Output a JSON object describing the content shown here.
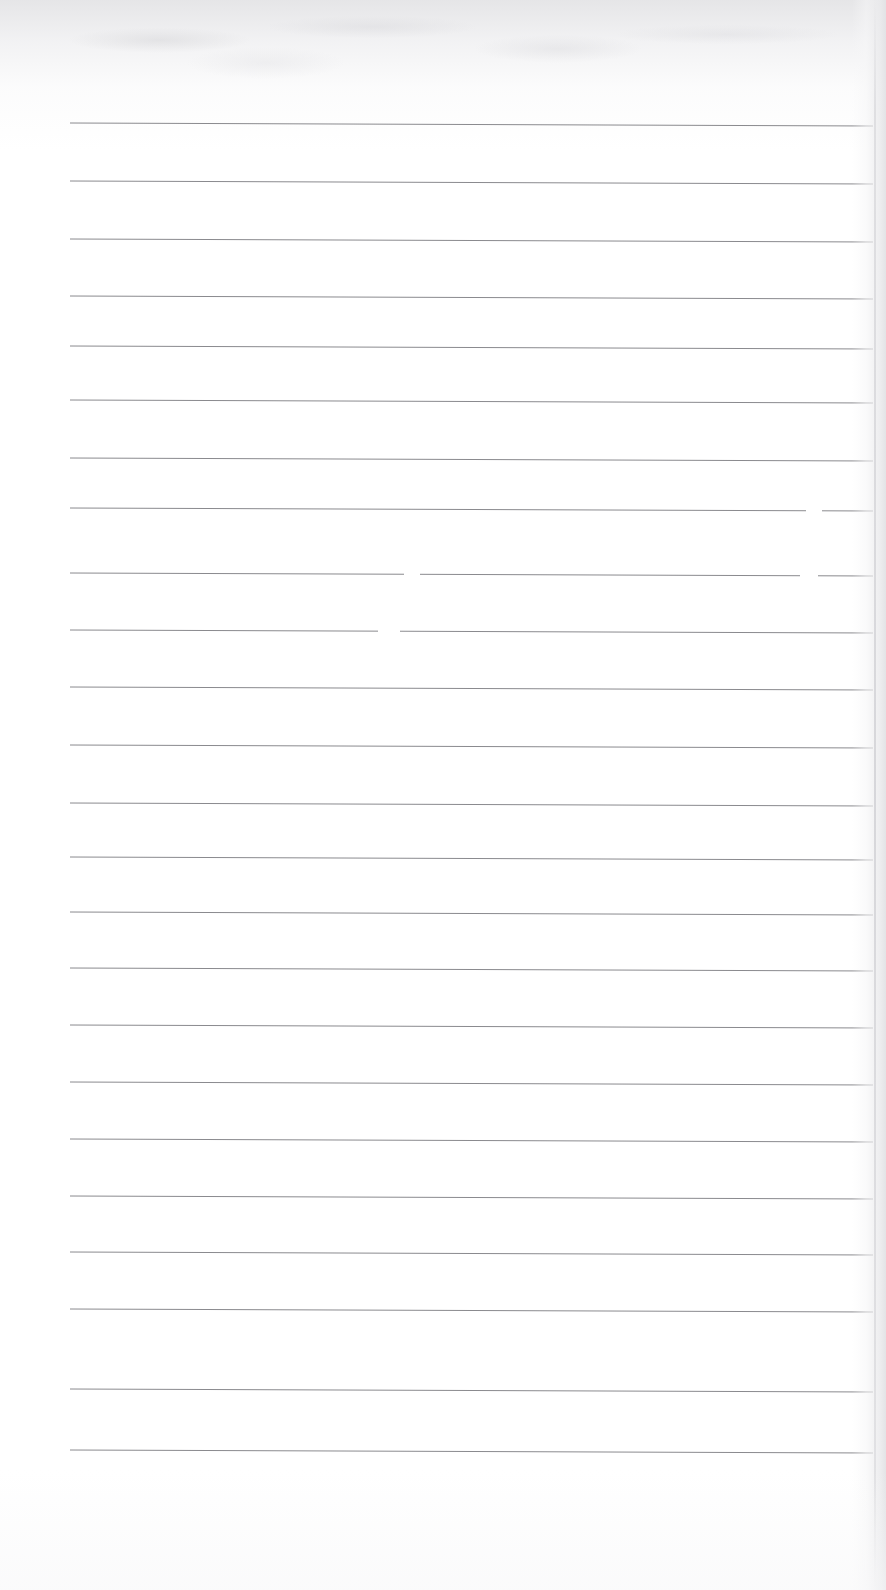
{
  "document": {
    "kind": "scanned-ruled-paper",
    "title": "Blank lined notebook page",
    "content_text": "",
    "page_width": 886,
    "page_height": 1590,
    "background_color": "#ffffff",
    "rule_color": "#8a8a8e",
    "shadow_color": "#e4e4e6"
  },
  "ruling": {
    "line_count": 24,
    "first_line_y": 123,
    "line_spacing": 57.7,
    "left_x": 70,
    "right_x": 873,
    "thickness": 1,
    "slope_drop_px": 3,
    "description": "Horizontal ruled lines, faintly tilted downward left-to-right"
  },
  "lines": [
    {
      "index": 1,
      "y": 123,
      "x1": 70,
      "x2": 873,
      "drop": 3,
      "gaps": []
    },
    {
      "index": 2,
      "y": 181,
      "x1": 70,
      "x2": 873,
      "drop": 3,
      "gaps": []
    },
    {
      "index": 3,
      "y": 239,
      "x1": 70,
      "x2": 873,
      "drop": 3,
      "gaps": []
    },
    {
      "index": 4,
      "y": 296,
      "x1": 70,
      "x2": 873,
      "drop": 3,
      "gaps": []
    },
    {
      "index": 5,
      "y": 346,
      "x1": 70,
      "x2": 873,
      "drop": 3,
      "gaps": []
    },
    {
      "index": 6,
      "y": 400,
      "x1": 70,
      "x2": 873,
      "drop": 3,
      "gaps": []
    },
    {
      "index": 7,
      "y": 458,
      "x1": 70,
      "x2": 873,
      "drop": 3,
      "gaps": []
    },
    {
      "index": 8,
      "y": 508,
      "x1": 70,
      "x2": 873,
      "drop": 3,
      "gaps": [
        {
          "start": 806,
          "end": 822
        }
      ]
    },
    {
      "index": 9,
      "y": 573,
      "x1": 70,
      "x2": 873,
      "drop": 3,
      "gaps": [
        {
          "start": 404,
          "end": 420
        },
        {
          "start": 800,
          "end": 818
        }
      ]
    },
    {
      "index": 10,
      "y": 630,
      "x1": 70,
      "x2": 873,
      "drop": 3,
      "gaps": [
        {
          "start": 378,
          "end": 400
        }
      ]
    },
    {
      "index": 11,
      "y": 687,
      "x1": 70,
      "x2": 873,
      "drop": 3,
      "gaps": []
    },
    {
      "index": 12,
      "y": 745,
      "x1": 70,
      "x2": 873,
      "drop": 3,
      "gaps": []
    },
    {
      "index": 13,
      "y": 803,
      "x1": 70,
      "x2": 873,
      "drop": 3,
      "gaps": []
    },
    {
      "index": 14,
      "y": 857,
      "x1": 70,
      "x2": 873,
      "drop": 3,
      "gaps": []
    },
    {
      "index": 15,
      "y": 912,
      "x1": 70,
      "x2": 873,
      "drop": 3,
      "gaps": []
    },
    {
      "index": 16,
      "y": 968,
      "x1": 70,
      "x2": 873,
      "drop": 3,
      "gaps": []
    },
    {
      "index": 17,
      "y": 1025,
      "x1": 70,
      "x2": 873,
      "drop": 3,
      "gaps": []
    },
    {
      "index": 18,
      "y": 1082,
      "x1": 70,
      "x2": 873,
      "drop": 3,
      "gaps": []
    },
    {
      "index": 19,
      "y": 1139,
      "x1": 70,
      "x2": 873,
      "drop": 3,
      "gaps": []
    },
    {
      "index": 20,
      "y": 1196,
      "x1": 70,
      "x2": 873,
      "drop": 3,
      "gaps": []
    },
    {
      "index": 21,
      "y": 1252,
      "x1": 70,
      "x2": 873,
      "drop": 3,
      "gaps": []
    },
    {
      "index": 22,
      "y": 1309,
      "x1": 70,
      "x2": 873,
      "drop": 3,
      "gaps": []
    },
    {
      "index": 23,
      "y": 1389,
      "x1": 70,
      "x2": 873,
      "drop": 3,
      "gaps": []
    },
    {
      "index": 24,
      "y": 1450,
      "x1": 70,
      "x2": 873,
      "drop": 3,
      "gaps": []
    }
  ]
}
